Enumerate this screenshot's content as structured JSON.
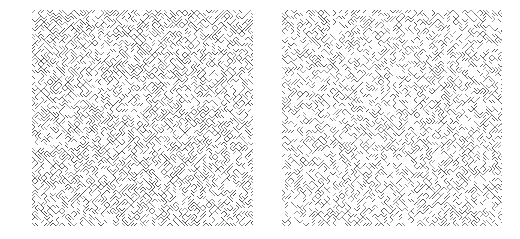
{
  "canvas": {
    "width": 520,
    "height": 239,
    "background": "#ffffff"
  },
  "panels": [
    {
      "id": "left",
      "label": "texture-left",
      "x": 32,
      "y": 10,
      "width": 221,
      "height": 216,
      "cell": 3,
      "density": 0.62,
      "ink": "#3a3a3a",
      "seed": 1337
    },
    {
      "id": "right",
      "label": "texture-right",
      "x": 282,
      "y": 10,
      "width": 220,
      "height": 216,
      "cell": 3,
      "density": 0.52,
      "ink": "#444444",
      "seed": 4242
    }
  ]
}
